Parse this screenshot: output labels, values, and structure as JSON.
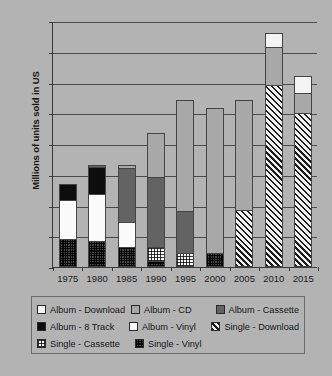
{
  "chart_data": {
    "type": "bar",
    "stacked": true,
    "title": "",
    "xlabel": "",
    "ylabel": "Millions of units sold in US",
    "ylim": [
      0,
      1600
    ],
    "ytick_step": 200,
    "yticks": [
      0,
      200,
      400,
      600,
      800,
      1000,
      1200,
      1400,
      1600
    ],
    "grid": true,
    "legend_position": "bottom",
    "categories": [
      "1975",
      "1980",
      "1985",
      "1990",
      "1995",
      "2000",
      "2005",
      "2010",
      "2015"
    ],
    "series": [
      {
        "name": "Album - Download",
        "key": "album-download",
        "values": [
          0,
          0,
          0,
          0,
          0,
          0,
          0,
          90,
          110
        ]
      },
      {
        "name": "Album - CD",
        "key": "album-cd",
        "values": [
          0,
          0,
          20,
          285,
          725,
          940,
          715,
          250,
          130
        ]
      },
      {
        "name": "Album - Cassette",
        "key": "album-cassette",
        "values": [
          0,
          10,
          350,
          455,
          270,
          0,
          0,
          0,
          0
        ]
      },
      {
        "name": "Album - 8 Track",
        "key": "album-8track",
        "values": [
          110,
          180,
          0,
          0,
          0,
          0,
          0,
          0,
          0
        ]
      },
      {
        "name": "Album - Vinyl",
        "key": "album-vinyl",
        "values": [
          250,
          305,
          160,
          0,
          0,
          0,
          0,
          0,
          0
        ]
      },
      {
        "name": "Single - Download",
        "key": "single-download",
        "values": [
          0,
          0,
          0,
          0,
          0,
          0,
          360,
          1170,
          990
        ]
      },
      {
        "name": "Single - Cassette",
        "key": "single-cassette",
        "values": [
          0,
          0,
          0,
          95,
          80,
          0,
          0,
          0,
          0
        ]
      },
      {
        "name": "Single - Vinyl",
        "key": "single-vinyl",
        "values": [
          170,
          155,
          120,
          25,
          0,
          80,
          0,
          0,
          0
        ]
      }
    ],
    "totals": [
      530,
      650,
      650,
      860,
      1075,
      1020,
      1075,
      1510,
      1230
    ]
  },
  "legend": {
    "rows": [
      [
        {
          "label": "Album - Download",
          "key": "album-download"
        },
        {
          "label": "Album - CD",
          "key": "album-cd"
        },
        {
          "label": "Album - Cassette",
          "key": "album-cassette"
        }
      ],
      [
        {
          "label": "Album - 8 Track",
          "key": "album-8track"
        },
        {
          "label": "Album - Vinyl",
          "key": "album-vinyl"
        },
        {
          "label": "Single - Download",
          "key": "single-download"
        }
      ],
      [
        {
          "label": "Single - Cassette",
          "key": "single-cassette"
        },
        {
          "label": "Single - Vinyl",
          "key": "single-vinyl"
        }
      ]
    ]
  }
}
